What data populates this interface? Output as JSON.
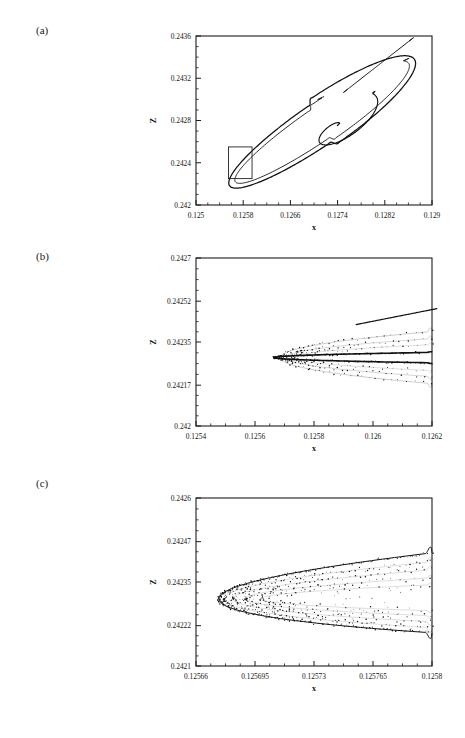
{
  "figure": {
    "panels": [
      {
        "id": "a",
        "label": "(a)",
        "xlabel": "x",
        "ylabel": "Z",
        "xlim": [
          0.125,
          0.129
        ],
        "ylim": [
          0.242,
          0.2436
        ],
        "xticks": [
          "0.125",
          "0.1258",
          "0.1266",
          "0.1274",
          "0.1282",
          "0.129"
        ],
        "xtickvals": [
          0.125,
          0.1258,
          0.1266,
          0.1274,
          0.1282,
          0.129
        ],
        "yticks": [
          "0.242",
          "0.2424",
          "0.2428",
          "0.2432",
          "0.2436"
        ],
        "ytickvals": [
          0.242,
          0.2424,
          0.2428,
          0.2432,
          0.2436
        ],
        "minor_ticks_per_interval": 4,
        "inset_box": {
          "x0": 0.12555,
          "x1": 0.12595,
          "y0": 0.24225,
          "y1": 0.24255
        }
      },
      {
        "id": "b",
        "label": "(b)",
        "xlabel": "x",
        "ylabel": "Z",
        "xlim": [
          0.1254,
          0.1262
        ],
        "ylim": [
          0.242,
          0.2427
        ],
        "xticks": [
          "0.1254",
          "0.1256",
          "0.1258",
          "0.126",
          "0.1262"
        ],
        "xtickvals": [
          0.1254,
          0.1256,
          0.1258,
          0.126,
          0.1262
        ],
        "yticks": [
          "0.242",
          "0.24217",
          "0.24235",
          "0.24252",
          "0.2427"
        ],
        "ytickvals": [
          0.242,
          0.24217,
          0.24235,
          0.24252,
          0.2427
        ],
        "minor_ticks_per_interval": 4
      },
      {
        "id": "c",
        "label": "(c)",
        "xlabel": "x",
        "ylabel": "Z",
        "xlim": [
          0.12566,
          0.1258
        ],
        "ylim": [
          0.2421,
          0.2426
        ],
        "xticks": [
          "0.12566",
          "0.125695",
          "0.12573",
          "0.125765",
          "0.1258"
        ],
        "xtickvals": [
          0.12566,
          0.125695,
          0.12573,
          0.125765,
          0.1258
        ],
        "yticks": [
          "0.2421",
          "0.24222",
          "0.24235",
          "0.24247",
          "0.2426"
        ],
        "ytickvals": [
          0.2421,
          0.24222,
          0.24235,
          0.24247,
          0.2426
        ],
        "minor_ticks_per_interval": 4
      }
    ]
  },
  "chart_data": [
    {
      "type": "line",
      "panel": "a",
      "title": "",
      "xlabel": "x",
      "ylabel": "Z",
      "xlim": [
        0.125,
        0.129
      ],
      "ylim": [
        0.242,
        0.2436
      ],
      "grid": false,
      "legend": "none",
      "description": "Chaotic attractor: elongated ellipse-like outer loop with inward spiral scroll",
      "series": [
        {
          "name": "outer-loop",
          "x": [
            0.12862,
            0.12818,
            0.1274,
            0.1265,
            0.1257,
            0.12552,
            0.12556,
            0.12588,
            0.1266,
            0.1276,
            0.12848,
            0.12878,
            0.1288,
            0.12862
          ],
          "y": [
            0.24312,
            0.24345,
            0.24343,
            0.243,
            0.24255,
            0.24232,
            0.24222,
            0.24222,
            0.2424,
            0.24268,
            0.24295,
            0.24302,
            0.24308,
            0.24312
          ]
        },
        {
          "name": "inner-scroll",
          "x": [
            0.12872,
            0.1282,
            0.1276,
            0.1272,
            0.127,
            0.12706,
            0.12726,
            0.12748,
            0.12756,
            0.12744,
            0.12726,
            0.12716
          ],
          "y": [
            0.24292,
            0.24278,
            0.24268,
            0.24268,
            0.2428,
            0.2429,
            0.24294,
            0.24288,
            0.24278,
            0.24272,
            0.24274,
            0.2428
          ]
        }
      ]
    },
    {
      "type": "line",
      "panel": "b",
      "title": "",
      "xlabel": "x",
      "ylabel": "Z",
      "xlim": [
        0.1254,
        0.1262
      ],
      "ylim": [
        0.242,
        0.2427
      ],
      "grid": false,
      "legend": "none",
      "description": "Magnification of boxed region in (a): parabolic fold with fine filaments",
      "series": [
        {
          "name": "fold-upper",
          "x": [
            0.1262,
            0.126,
            0.1258,
            0.12572,
            0.12568,
            0.12567,
            0.12568
          ],
          "y": [
            0.2427,
            0.24265,
            0.24252,
            0.24243,
            0.24238,
            0.24232,
            0.24228
          ]
        },
        {
          "name": "fold-lower",
          "x": [
            0.12568,
            0.12572,
            0.12582,
            0.126,
            0.1262
          ],
          "y": [
            0.24228,
            0.24221,
            0.24215,
            0.24214,
            0.24216
          ]
        },
        {
          "name": "inner-filament",
          "x": [
            0.1262,
            0.126,
            0.12585,
            0.12576,
            0.12572,
            0.12574,
            0.12582,
            0.126,
            0.1262
          ],
          "y": [
            0.24268,
            0.24258,
            0.24246,
            0.24238,
            0.24231,
            0.24224,
            0.24218,
            0.24216,
            0.24217
          ]
        }
      ]
    },
    {
      "type": "scatter",
      "panel": "c",
      "title": "",
      "xlabel": "x",
      "ylabel": "Z",
      "xlim": [
        0.12566,
        0.1258
      ],
      "ylim": [
        0.2421,
        0.2426
      ],
      "grid": false,
      "legend": "none",
      "description": "Second magnification: fractal filamentary fold, multiple nearly parallel sheets",
      "series": [
        {
          "name": "sheet-upper",
          "x": [
            0.1258,
            0.125775,
            0.125745,
            0.125715,
            0.12569,
            0.125675,
            0.125668,
            0.125666
          ],
          "y": [
            0.242505,
            0.242475,
            0.242435,
            0.242395,
            0.242355,
            0.24232,
            0.24229,
            0.242265
          ]
        },
        {
          "name": "sheet-lower",
          "x": [
            0.125666,
            0.125672,
            0.12569,
            0.12572,
            0.12576,
            0.1258
          ],
          "y": [
            0.242265,
            0.242235,
            0.242205,
            0.24218,
            0.242165,
            0.24216
          ]
        },
        {
          "name": "sheet-inner",
          "x": [
            0.1258,
            0.12577,
            0.12574,
            0.125715,
            0.1257,
            0.125702,
            0.125718,
            0.12575,
            0.1258
          ],
          "y": [
            0.24247,
            0.24243,
            0.24238,
            0.24233,
            0.242285,
            0.242245,
            0.24221,
            0.242185,
            0.24218
          ]
        }
      ]
    }
  ]
}
